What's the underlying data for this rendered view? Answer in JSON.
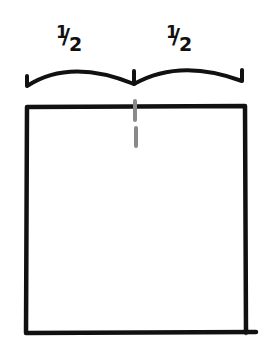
{
  "diagram": {
    "labels": [
      {
        "numerator": "1",
        "denominator": "2",
        "text": "1/2"
      },
      {
        "numerator": "1",
        "denominator": "2",
        "text": "1/2"
      }
    ],
    "brace": {
      "description": "Two-part curly brace spanning the top of the square, split at the midpoint"
    },
    "square": {
      "description": "Large square outline"
    },
    "divider": {
      "description": "Gray dashed vertical line at the midpoint of the top edge",
      "color": "#8a8a8a"
    },
    "stroke_color": "#111111"
  }
}
